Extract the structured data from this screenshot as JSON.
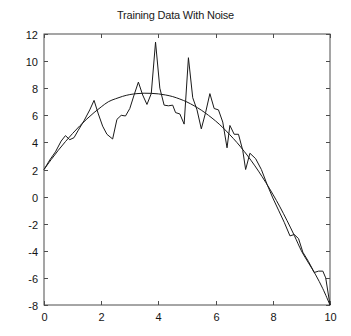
{
  "chart_data": {
    "type": "line",
    "title": "Training Data With Noise",
    "xlabel": "",
    "ylabel": "",
    "xlim": [
      0,
      10
    ],
    "ylim": [
      -8,
      12
    ],
    "xticks": [
      0,
      2,
      4,
      6,
      8,
      10
    ],
    "yticks": [
      -8,
      -6,
      -4,
      -2,
      0,
      2,
      4,
      6,
      8,
      10,
      12
    ],
    "xtick_labels": [
      "0",
      "2",
      "4",
      "6",
      "8",
      "10"
    ],
    "ytick_labels": [
      "-8",
      "-6",
      "-4",
      "-2",
      "0",
      "2",
      "4",
      "6",
      "8",
      "10",
      "12"
    ],
    "grid": false,
    "legend": null,
    "legend_position": "none",
    "box": true,
    "tick_direction": "in",
    "line_color": "#1a1a1a",
    "background_color": "#ffffff",
    "series": [
      {
        "name": "Underlying function",
        "style": "smooth-line",
        "x": [
          0.0,
          0.25,
          0.5,
          0.75,
          1.0,
          1.25,
          1.5,
          1.75,
          2.0,
          2.25,
          2.5,
          2.75,
          3.0,
          3.25,
          3.5,
          3.75,
          4.0,
          4.25,
          4.5,
          4.75,
          5.0,
          5.25,
          5.5,
          5.75,
          6.0,
          6.25,
          6.5,
          6.75,
          7.0,
          7.25,
          7.5,
          7.75,
          8.0,
          8.25,
          8.5,
          8.75,
          9.0,
          9.25,
          9.5,
          9.75,
          10.0
        ],
        "values": [
          2.0,
          2.73,
          3.42,
          4.06,
          4.66,
          5.22,
          5.73,
          6.2,
          6.62,
          7.0,
          7.22,
          7.4,
          7.53,
          7.6,
          7.63,
          7.62,
          7.58,
          7.5,
          7.38,
          7.2,
          6.98,
          6.7,
          6.38,
          6.0,
          5.58,
          5.1,
          4.56,
          3.98,
          3.34,
          2.64,
          1.88,
          1.06,
          0.18,
          -0.76,
          -1.78,
          -2.86,
          -4.0,
          -4.9,
          -5.78,
          -6.8,
          -8.0
        ]
      },
      {
        "name": "Training data with noise",
        "style": "noisy-line",
        "x": [
          0.0,
          0.2,
          0.4,
          0.6,
          0.75,
          0.9,
          1.05,
          1.2,
          1.4,
          1.6,
          1.75,
          1.9,
          2.05,
          2.2,
          2.4,
          2.55,
          2.7,
          2.85,
          3.0,
          3.15,
          3.3,
          3.45,
          3.6,
          3.75,
          3.9,
          4.05,
          4.2,
          4.35,
          4.5,
          4.6,
          4.75,
          4.9,
          5.05,
          5.2,
          5.35,
          5.5,
          5.65,
          5.8,
          5.95,
          6.1,
          6.25,
          6.4,
          6.5,
          6.65,
          6.8,
          6.95,
          7.05,
          7.2,
          7.4,
          7.6,
          7.8,
          8.0,
          8.2,
          8.4,
          8.6,
          8.75,
          8.9,
          9.05,
          9.25,
          9.45,
          9.6,
          9.75,
          9.85,
          10.0
        ],
        "values": [
          2.0,
          2.7,
          3.3,
          4.1,
          4.5,
          4.2,
          4.35,
          4.9,
          5.6,
          6.4,
          7.1,
          6.1,
          5.2,
          4.6,
          4.25,
          5.7,
          6.0,
          5.95,
          6.5,
          7.5,
          8.45,
          7.5,
          6.8,
          7.6,
          11.4,
          8.0,
          6.75,
          6.7,
          6.75,
          6.2,
          6.1,
          5.35,
          10.25,
          7.3,
          6.4,
          5.0,
          6.2,
          7.6,
          6.5,
          6.4,
          5.5,
          3.6,
          5.25,
          4.6,
          4.6,
          3.4,
          2.0,
          3.2,
          2.8,
          2.0,
          0.9,
          -0.1,
          -1.0,
          -1.9,
          -2.9,
          -2.8,
          -3.1,
          -4.1,
          -4.8,
          -5.6,
          -5.5,
          -5.5,
          -6.0,
          -8.0
        ]
      }
    ]
  },
  "axes": {
    "left": 44,
    "right": 330,
    "top": 34,
    "bottom": 305
  }
}
